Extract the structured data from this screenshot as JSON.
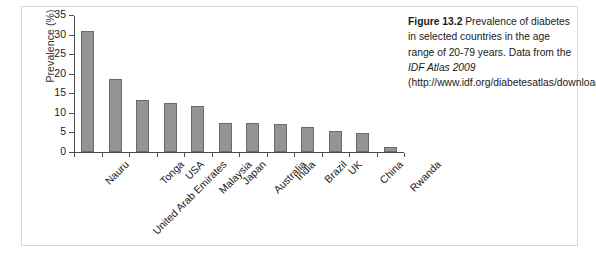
{
  "chart_data": {
    "type": "bar",
    "title": "",
    "xlabel": "",
    "ylabel": "Prevalence (%)",
    "ylim": [
      0,
      35
    ],
    "yticks": [
      0,
      5,
      10,
      15,
      20,
      25,
      30,
      35
    ],
    "grid": false,
    "legend": "none",
    "bar_color": "#949494",
    "bar_edge_color": "#6b6b6b",
    "categories": [
      "Nauru",
      "United Arab Emirates",
      "Tonga",
      "USA",
      "Malaysia",
      "Japan",
      "Australia",
      "India",
      "Brazil",
      "UK",
      "China",
      "Rwanda"
    ],
    "values": [
      30.9,
      18.7,
      13.4,
      12.4,
      11.7,
      7.5,
      7.4,
      7.2,
      6.4,
      5.3,
      4.8,
      1.3
    ]
  },
  "caption": {
    "figure_number": "Figure 13.2",
    "text_part_1": " Prevalence of diabetes in selected countries in the age range of 20-79 years. Data from the ",
    "source_italic": "IDF Atlas 2009",
    "text_part_2": " (http://www.idf.org/diabetesatlas/downloads)."
  }
}
